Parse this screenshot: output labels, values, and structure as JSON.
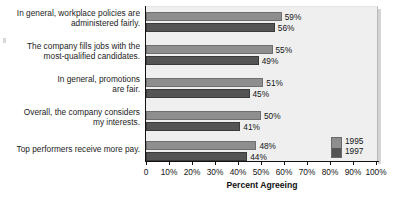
{
  "chart_data": {
    "type": "bar",
    "orientation": "horizontal",
    "title": "",
    "xlabel": "Percent Agreeing",
    "ylabel": "",
    "xlim": [
      0,
      100
    ],
    "xticks": [
      "0",
      "10%",
      "20%",
      "30%",
      "40%",
      "50%",
      "60%",
      "70%",
      "80%",
      "90%",
      "100%"
    ],
    "xtick_values": [
      0,
      10,
      20,
      30,
      40,
      50,
      60,
      70,
      80,
      90,
      100
    ],
    "grid": false,
    "legend_position": "inside-bottom-right",
    "categories": [
      "In general, workplace policies are administered fairly.",
      "The company fills jobs with the most-qualified candidates.",
      "In general, promotions are fair.",
      "Overall, the company considers my interests.",
      "Top performers receive more pay."
    ],
    "series": [
      {
        "name": "1995",
        "color": "#8e8e8e",
        "values": [
          59,
          55,
          51,
          50,
          48
        ],
        "value_labels": [
          "59%",
          "55%",
          "51%",
          "50%",
          "48%"
        ]
      },
      {
        "name": "1997",
        "color": "#545454",
        "values": [
          56,
          49,
          45,
          41,
          44
        ],
        "value_labels": [
          "56%",
          "49%",
          "45%",
          "41%",
          "44%"
        ]
      }
    ]
  },
  "category_lines": [
    [
      "In general, workplace policies are",
      "administered fairly."
    ],
    [
      "The company fills jobs with the",
      "most-qualified candidates."
    ],
    [
      "In general, promotions",
      "are fair."
    ],
    [
      "Overall, the company considers",
      "my interests."
    ],
    [
      "Top performers receive more pay."
    ]
  ],
  "legend": {
    "items": [
      {
        "label": "1995"
      },
      {
        "label": "1997"
      }
    ]
  }
}
